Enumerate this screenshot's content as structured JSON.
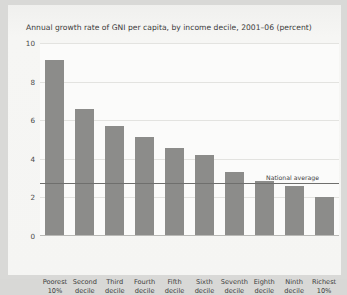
{
  "chart_data": {
    "type": "bar",
    "title": "Annual growth rate of GNI per capita, by income decile, 2001–06 (percent)",
    "xlabel": "",
    "ylabel": "",
    "ylim": [
      0,
      10
    ],
    "yticks": [
      0,
      2,
      4,
      6,
      8,
      10
    ],
    "grid": true,
    "legend": false,
    "categories": [
      "Poorest 10%",
      "Second decile",
      "Third decile",
      "Fourth decile",
      "Fifth decile",
      "Sixth decile",
      "Seventh decile",
      "Eighth decile",
      "Ninth decile",
      "Richest 10%"
    ],
    "category_lines": [
      [
        "Poorest",
        "10%"
      ],
      [
        "Second",
        "decile"
      ],
      [
        "Third",
        "decile"
      ],
      [
        "Fourth",
        "decile"
      ],
      [
        "Fifth",
        "decile"
      ],
      [
        "Sixth",
        "decile"
      ],
      [
        "Seventh",
        "decile"
      ],
      [
        "Eighth",
        "decile"
      ],
      [
        "Ninth",
        "decile"
      ],
      [
        "Richest",
        "10%"
      ]
    ],
    "values": [
      9.1,
      6.6,
      5.7,
      5.15,
      4.55,
      4.2,
      3.3,
      2.85,
      2.6,
      2.0
    ],
    "annotations": [
      {
        "label": "National average",
        "type": "hline",
        "value": 2.75
      }
    ],
    "colors": {
      "bar": "#8c8c8a",
      "gridline": "#e3e3e0",
      "axis": "#b9b9b6",
      "average_line": "#6f6f6d",
      "plot_background": "#fbfbfa",
      "panel_background": "#f5f5f3",
      "page_background": "#d9d9d7",
      "text": "#3b3b3b"
    }
  }
}
